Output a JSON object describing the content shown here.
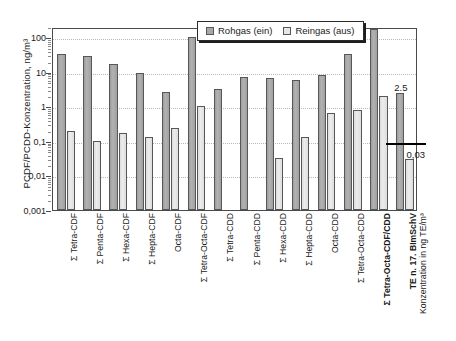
{
  "chart_data": {
    "type": "bar",
    "title": "",
    "subtitle": "",
    "ylabel": "PCDF/PCDD-Konzentration, ng/m³",
    "xlabel": "",
    "right_axis_label": "Grenzwert 17. BImSchV",
    "yscale": "log",
    "ylim": [
      0.001,
      200
    ],
    "ytick_labels": [
      "100",
      "10",
      "1",
      "0,1",
      "0,01",
      "0,001"
    ],
    "ytick_values": [
      100,
      10,
      1,
      0.1,
      0.01,
      0.001
    ],
    "grid": true,
    "legend_position": "top-center",
    "categories": [
      "Σ Tetra-CDF",
      "Σ Penta-CDF",
      "Σ Hexa-CDF",
      "Σ Hepta-CDF",
      "Octa-CDF",
      "Σ Tetra-Octa-CDF",
      "Σ Tetra-CDD",
      "Σ Penta-CDD",
      "Σ Hexa-CDD",
      "Σ Hepta-CDD",
      "Octa-CDD",
      "Σ Tetra-Octa-CDD",
      "Σ Tetra-Octa-CDF/CDD",
      "TE n. 17. BImSchV"
    ],
    "category_styles": [
      "normal",
      "normal",
      "normal",
      "normal",
      "normal",
      "normal",
      "normal",
      "normal",
      "normal",
      "normal",
      "normal",
      "normal",
      "bold",
      "bold"
    ],
    "category_sublabels": [
      "",
      "",
      "",
      "",
      "",
      "",
      "",
      "",
      "",
      "",
      "",
      "",
      "",
      "Konzentration in ng TE/m³"
    ],
    "series": [
      {
        "name": "Rohgas (ein)",
        "color": "#a8a8a8",
        "values": [
          32,
          28,
          17,
          9.3,
          2.6,
          100,
          3.2,
          7.2,
          6.6,
          5.8,
          8.0,
          32,
          170,
          2.5
        ]
      },
      {
        "name": "Reingas (aus)",
        "color": "#e6e6e6",
        "values": [
          0.2,
          0.1,
          0.17,
          0.13,
          0.23,
          1.0,
          null,
          null,
          0.033,
          0.13,
          0.65,
          0.8,
          2.0,
          0.03
        ]
      }
    ],
    "annotations": [
      {
        "text": "2.5",
        "category": "TE n. 17. BImSchV",
        "series": "Rohgas (ein)"
      },
      {
        "text": "0,03",
        "category": "TE n. 17. BImSchV",
        "series": "Reingas (aus)"
      }
    ],
    "limit_line": {
      "label": "Grenzwert 17. BImSchV",
      "value": 0.1,
      "color": "#000000"
    }
  },
  "legend": {
    "items": [
      {
        "label": "Rohgas (ein)",
        "key": "roh"
      },
      {
        "label": "Reingas (aus)",
        "key": "rein"
      }
    ]
  },
  "colors": {
    "rohgas": "#a8a8a8",
    "reingas": "#e6e6e6",
    "axis": "#4a4a4a",
    "grid": "#b9b9b9",
    "limit": "#000000"
  }
}
